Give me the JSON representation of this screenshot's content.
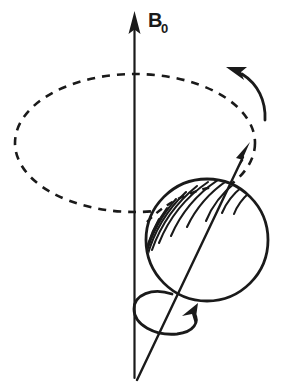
{
  "figure": {
    "background_color": "#ffffff",
    "ink_color": "#1a1a1a",
    "width": 281,
    "height": 387
  },
  "labels": {
    "field_axis_symbol": "B",
    "field_axis_subscript": "0",
    "field_axis_full": "B0"
  },
  "elements": {
    "field_axis": {
      "name": "main-magnetic-field-axis",
      "description": "vertical arrow pointing up labelled B0",
      "arrow_direction": "up"
    },
    "precession_orbit": {
      "name": "precession-orbit-ellipse",
      "style": "dashed",
      "description": "dashed ellipse traced by the tip of the magnetic moment"
    },
    "precession_arrow": {
      "name": "precession-direction-arrow",
      "description": "curved arrow at upper right showing counter-clockwise precession",
      "arrow_direction": "counter-clockwise"
    },
    "magnetic_moment_arrow": {
      "name": "magnetic-moment-arrow",
      "description": "tilted arrow from the nucleus pointing up and to the right"
    },
    "nucleus": {
      "name": "spinning-nucleus-sphere",
      "description": "hatched sphere representing the spinning nucleus"
    },
    "spin_arrow": {
      "name": "spin-rotation-arrow",
      "description": "looped arrow around the moment axis showing the nuclear spin"
    }
  }
}
